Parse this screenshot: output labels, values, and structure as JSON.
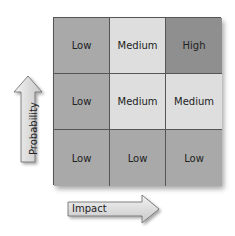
{
  "matrix": {
    "rows": [
      [
        "Low",
        "Medium",
        "High"
      ],
      [
        "Low",
        "Medium",
        "Medium"
      ],
      [
        "Low",
        "Low",
        "Low"
      ]
    ],
    "colors": {
      "Low": "#a9a9a9",
      "Medium": "#dedede",
      "High": "#8f8f8f"
    }
  },
  "axes": {
    "y_label": "Probability",
    "x_label": "Impact"
  }
}
